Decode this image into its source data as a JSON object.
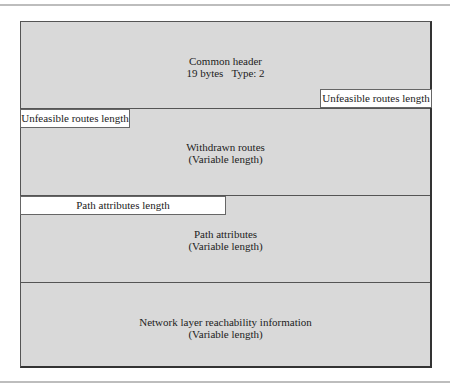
{
  "diagram": {
    "colors": {
      "section_fill": "#d9d9d9",
      "label_fill": "#ffffff",
      "border": "#555555"
    },
    "sections": [
      {
        "name": "common-header",
        "lines": [
          "Common header",
          "19 bytes   Type: 2"
        ]
      },
      {
        "name": "withdrawn-routes",
        "lines": [
          "Withdrawn routes",
          "(Variable length)"
        ]
      },
      {
        "name": "path-attributes",
        "lines": [
          "Path attributes",
          "(Variable length)"
        ]
      },
      {
        "name": "nlri",
        "lines": [
          "Network layer reachability information",
          "(Variable length)"
        ]
      }
    ],
    "fields": {
      "unfeasible_right": "Unfeasible routes length",
      "unfeasible_left": "Unfeasible routes length",
      "path_attr_length": "Path attributes length"
    }
  }
}
